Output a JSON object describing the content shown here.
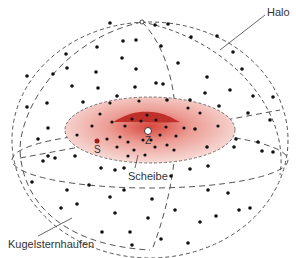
{
  "diagram": {
    "labels": {
      "halo": "Halo",
      "disk": "Scheibe",
      "globular_clusters": "Kugelsternhaufen",
      "sun": "S",
      "center": "Z"
    },
    "colors": {
      "disk_fill": "#e88a80",
      "bulge_fill": "#c0302a",
      "line": "#555555",
      "dot": "#111111"
    }
  }
}
